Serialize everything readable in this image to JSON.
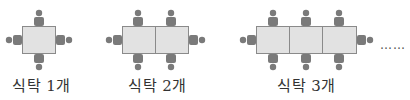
{
  "diagram": {
    "colors": {
      "table_fill": "#e2e2e2",
      "table_border": "#8a8a8a",
      "person": "#7a7a7a"
    },
    "groups": [
      {
        "tables": 1,
        "label": "식탁 1개",
        "people": 4
      },
      {
        "tables": 2,
        "label": "식탁 2개",
        "people": 6
      },
      {
        "tables": 3,
        "label": "식탁 3개",
        "people": 8
      }
    ],
    "continuation": "……"
  }
}
